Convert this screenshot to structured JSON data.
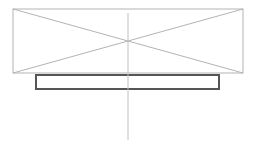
{
  "canvas": {
    "width": 258,
    "height": 144,
    "background_color": "#ffffff",
    "title": "Elevation line drawing with crossed rectangle and base plate"
  },
  "style": {
    "thin_line_color": "#b3b3b3",
    "thin_line_width": 1,
    "thick_line_color": "#555555",
    "thick_line_width": 2,
    "centerline_color": "#c0c0c0",
    "centerline_width": 1,
    "fill_color": "#ffffff"
  },
  "shapes": {
    "outer_rectangle": {
      "name": "crossed-rectangle",
      "x": 13,
      "y": 9,
      "width": 230,
      "height": 64,
      "stroke": "#b3b3b3",
      "stroke_width": 1,
      "fill": "none"
    },
    "diagonal_a": {
      "name": "diagonal-top-left-to-bottom-right",
      "x1": 13,
      "y1": 9,
      "x2": 243,
      "y2": 73,
      "stroke": "#b3b3b3",
      "stroke_width": 1
    },
    "diagonal_b": {
      "name": "diagonal-bottom-left-to-top-right",
      "x1": 13,
      "y1": 73,
      "x2": 243,
      "y2": 9,
      "stroke": "#b3b3b3",
      "stroke_width": 1
    },
    "base_bar": {
      "name": "base-plate-bar",
      "x": 36,
      "y": 75,
      "width": 183,
      "height": 14,
      "stroke": "#555555",
      "stroke_width": 2,
      "fill": "#ffffff"
    },
    "center_line": {
      "name": "vertical-centerline",
      "x1": 128,
      "y1": 13,
      "x2": 128,
      "y2": 140,
      "stroke": "#c0c0c0",
      "stroke_width": 1
    },
    "intersection_point": {
      "name": "diagonal-intersection",
      "x": 128,
      "y": 41
    }
  },
  "labels": {
    "none_visible": ""
  }
}
